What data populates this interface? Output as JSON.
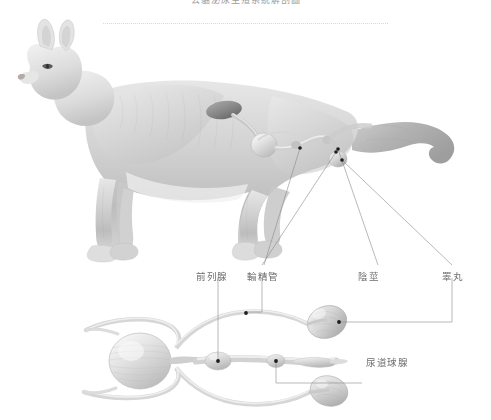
{
  "page": {
    "width": 491,
    "height": 420,
    "background": "#ffffff",
    "title": "公貓泌尿生殖系統解剖圖",
    "title_color": "#9a9a9a",
    "label_color": "#6e6e6e",
    "leader_color": "#8a8a8a",
    "illustration_style": "grayscale-pencil"
  },
  "labels": {
    "prostate": "前列腺",
    "vas_deferens": "輸精管",
    "penis": "陰莖",
    "testis": "睪丸",
    "bulbourethral_gland": "尿道球腺"
  },
  "figures": {
    "cat": {
      "name": "公貓側面輪廓圖",
      "description": "灰階鉛筆風格的公貓側面站姿，內部透視顯示腎臟、輸尿管、膀胱與生殖器官"
    },
    "organs_detail": {
      "name": "泌尿生殖器官俯視放大圖",
      "description": "膀胱、輸尿管、輸精管、前列腺、尿道球腺、陰莖與兩側睪丸"
    }
  }
}
